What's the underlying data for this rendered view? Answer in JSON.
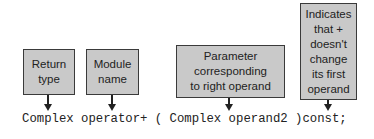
{
  "diagram": {
    "type": "annotated-code-signature",
    "colors": {
      "box_fill": "#c9c9c9",
      "box_border": "#3a3a3a",
      "text": "#222222",
      "background": "#ffffff"
    },
    "annotations": [
      {
        "id": "return-type",
        "label": "Return\ntype",
        "points_to": "Complex"
      },
      {
        "id": "module-name",
        "label": "Module\nname",
        "points_to": "operator+"
      },
      {
        "id": "right-operand",
        "label": "Parameter\ncorresponding\nto right operand",
        "points_to": "Complex operand2"
      },
      {
        "id": "const",
        "label": "Indicates\nthat +\ndoesn't\nchange\nits first\noperand",
        "points_to": "const"
      }
    ],
    "code_line": "Complex operator+ ( Complex operand2 )const;"
  }
}
